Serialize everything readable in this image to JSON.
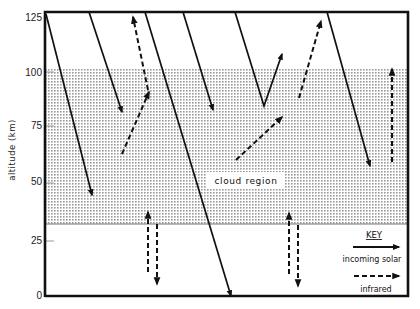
{
  "axis": {
    "ylabel": "altitude (km)",
    "ticks": [
      "125",
      "100",
      "75",
      "50",
      "25",
      "0"
    ]
  },
  "region": {
    "label": "cloud region",
    "bottom_km": 33,
    "top_km": 70
  },
  "key": {
    "title": "KEY",
    "entries": [
      {
        "label": "incoming solar",
        "style": "solid"
      },
      {
        "label": "infrared",
        "style": "dashed"
      }
    ]
  },
  "arrows": {
    "solar": [
      {
        "from_km": 125,
        "to_km": 43,
        "note": "penetrates into cloud"
      },
      {
        "from_km": 125,
        "to_km": 83,
        "note": "absorbed above cloud"
      },
      {
        "from_km": 125,
        "to_km": 0,
        "note": "reaches surface"
      },
      {
        "from_km": 125,
        "to_km": 85,
        "note": "absorbed above cloud"
      },
      {
        "from_km": 125,
        "to_km": 85,
        "note": "reflected upward to 110 km"
      },
      {
        "from_km": 125,
        "to_km": 57,
        "note": "penetrates into cloud"
      }
    ],
    "infrared": [
      {
        "from_km": 62,
        "to_km": 125,
        "note": "emitted from cloud top upward"
      },
      {
        "from_km": 60,
        "to_km": 80,
        "note": "emitted from cloud"
      },
      {
        "from_km": 90,
        "to_km": 125,
        "note": "upward"
      },
      {
        "from_km": 60,
        "to_km": 103,
        "note": "upward from cloud"
      },
      {
        "from_km": 10,
        "to_km": 33,
        "note": "up/down exchange below cloud"
      },
      {
        "from_km": 10,
        "to_km": 33,
        "note": "up/down exchange below cloud"
      }
    ]
  }
}
